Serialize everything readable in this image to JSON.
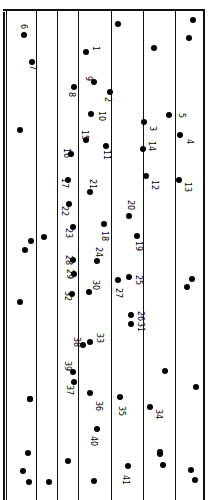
{
  "diagram": {
    "type": "connect-the-dots drawing on ruled paper (rotated 90°)",
    "ruled_lines_x": [
      36,
      57,
      78,
      111,
      143,
      175
    ],
    "numbered_points": [
      {
        "n": "1",
        "x": 86,
        "y": 52,
        "lx": 91,
        "ly": 46
      },
      {
        "n": "2",
        "x": 110,
        "y": 92,
        "lx": 103,
        "ly": 97
      },
      {
        "n": "3",
        "x": 144,
        "y": 122,
        "lx": 148,
        "ly": 126
      },
      {
        "n": "4",
        "x": 180,
        "y": 135,
        "lx": 185,
        "ly": 139
      },
      {
        "n": "5",
        "x": 169,
        "y": 115,
        "lx": 177,
        "ly": 113
      },
      {
        "n": "6",
        "x": 24,
        "y": 35,
        "lx": 19,
        "ly": 24
      },
      {
        "n": "7",
        "x": 32,
        "y": 62,
        "lx": 28,
        "ly": 65
      },
      {
        "n": "8",
        "x": 74,
        "y": 87,
        "lx": 67,
        "ly": 92
      },
      {
        "n": "9",
        "x": 94,
        "y": 82,
        "lx": 84,
        "ly": 76
      },
      {
        "n": "10",
        "x": 91,
        "y": 114,
        "lx": 97,
        "ly": 111
      },
      {
        "n": "11",
        "x": 106,
        "y": 146,
        "lx": 102,
        "ly": 150
      },
      {
        "n": "12",
        "x": 146,
        "y": 176,
        "lx": 150,
        "ly": 180
      },
      {
        "n": "13",
        "x": 179,
        "y": 180,
        "lx": 183,
        "ly": 182
      },
      {
        "n": "14",
        "x": 143,
        "y": 149,
        "lx": 147,
        "ly": 141
      },
      {
        "n": "15",
        "x": 86,
        "y": 140,
        "lx": 80,
        "ly": 130
      },
      {
        "n": "16",
        "x": 71,
        "y": 154,
        "lx": 62,
        "ly": 148
      },
      {
        "n": "17",
        "x": 68,
        "y": 180,
        "lx": 60,
        "ly": 178
      },
      {
        "n": "18",
        "x": 104,
        "y": 224,
        "lx": 100,
        "ly": 231
      },
      {
        "n": "19",
        "x": 137,
        "y": 236,
        "lx": 134,
        "ly": 241
      },
      {
        "n": "20",
        "x": 129,
        "y": 216,
        "lx": 126,
        "ly": 200
      },
      {
        "n": "21",
        "x": 90,
        "y": 192,
        "lx": 88,
        "ly": 179
      },
      {
        "n": "22",
        "x": 69,
        "y": 204,
        "lx": 60,
        "ly": 206
      },
      {
        "n": "23",
        "x": 73,
        "y": 227,
        "lx": 64,
        "ly": 228
      },
      {
        "n": "24",
        "x": 97,
        "y": 261,
        "lx": 94,
        "ly": 247
      },
      {
        "n": "25",
        "x": 129,
        "y": 277,
        "lx": 134,
        "ly": 275
      },
      {
        "n": "26",
        "x": 131,
        "y": 315,
        "lx": 136,
        "ly": 311
      },
      {
        "n": "27",
        "x": 118,
        "y": 280,
        "lx": 114,
        "ly": 288
      },
      {
        "n": "28",
        "x": 73,
        "y": 260,
        "lx": 64,
        "ly": 255
      },
      {
        "n": "29",
        "x": 74,
        "y": 274,
        "lx": 65,
        "ly": 269
      },
      {
        "n": "30",
        "x": 89,
        "y": 292,
        "lx": 91,
        "ly": 280
      },
      {
        "n": "31",
        "x": 131,
        "y": 324,
        "lx": 136,
        "ly": 322
      },
      {
        "n": "32",
        "x": 72,
        "y": 294,
        "lx": 63,
        "ly": 291
      },
      {
        "n": "33",
        "x": 90,
        "y": 342,
        "lx": 95,
        "ly": 333
      },
      {
        "n": "34",
        "x": 150,
        "y": 407,
        "lx": 154,
        "ly": 409
      },
      {
        "n": "35",
        "x": 120,
        "y": 397,
        "lx": 117,
        "ly": 406
      },
      {
        "n": "36",
        "x": 90,
        "y": 393,
        "lx": 94,
        "ly": 401
      },
      {
        "n": "37",
        "x": 74,
        "y": 382,
        "lx": 65,
        "ly": 385
      },
      {
        "n": "38",
        "x": 83,
        "y": 345,
        "lx": 72,
        "ly": 337
      },
      {
        "n": "39",
        "x": 73,
        "y": 372,
        "lx": 63,
        "ly": 361
      },
      {
        "n": "40",
        "x": 97,
        "y": 429,
        "lx": 89,
        "ly": 436
      },
      {
        "n": "41",
        "x": 128,
        "y": 466,
        "lx": 121,
        "ly": 475
      }
    ],
    "unlabeled_points": [
      {
        "x": 118,
        "y": 24
      },
      {
        "x": 193,
        "y": 20
      },
      {
        "x": 189,
        "y": 38
      },
      {
        "x": 154,
        "y": 48
      },
      {
        "x": 20,
        "y": 130
      },
      {
        "x": 31,
        "y": 241
      },
      {
        "x": 25,
        "y": 250
      },
      {
        "x": 44,
        "y": 237
      },
      {
        "x": 192,
        "y": 279
      },
      {
        "x": 187,
        "y": 287
      },
      {
        "x": 20,
        "y": 302
      },
      {
        "x": 165,
        "y": 371
      },
      {
        "x": 196,
        "y": 387
      },
      {
        "x": 30,
        "y": 399
      },
      {
        "x": 30,
        "y": 399
      },
      {
        "x": 28,
        "y": 453
      },
      {
        "x": 23,
        "y": 471
      },
      {
        "x": 29,
        "y": 482
      },
      {
        "x": 49,
        "y": 482
      },
      {
        "x": 68,
        "y": 461
      },
      {
        "x": 94,
        "y": 481
      },
      {
        "x": 160,
        "y": 452
      },
      {
        "x": 163,
        "y": 465
      },
      {
        "x": 191,
        "y": 470
      },
      {
        "x": 195,
        "y": 480
      },
      {
        "x": 160,
        "y": 454
      }
    ]
  }
}
